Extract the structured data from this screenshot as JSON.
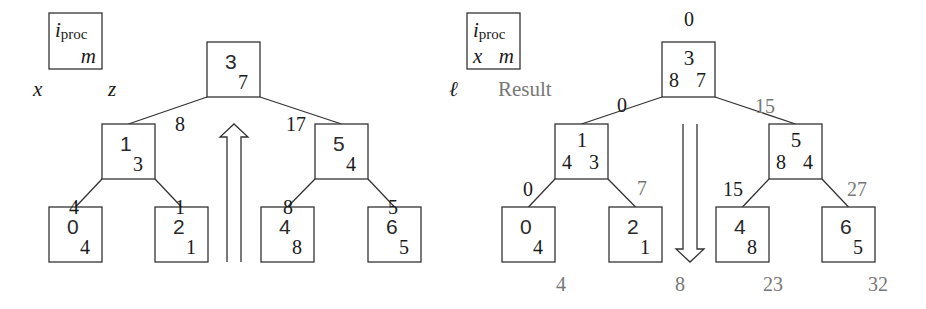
{
  "colors": {
    "stroke": "#333333",
    "text": "#1a1a1a",
    "result_gray": "#777777"
  },
  "left": {
    "legend": {
      "box": {
        "x": 49,
        "y": 13,
        "w": 53,
        "h": 56
      },
      "top_label": "i",
      "top_label_sub": "proc",
      "bottom_right": "m",
      "below_left": "x",
      "below_right": "z"
    },
    "nodes": [
      {
        "id": "3",
        "x": 207,
        "y": 42,
        "m": "7"
      },
      {
        "id": "1",
        "x": 102,
        "y": 124,
        "m": "3"
      },
      {
        "id": "5",
        "x": 315,
        "y": 124,
        "m": "4"
      },
      {
        "id": "0",
        "x": 49,
        "y": 207,
        "m": "4"
      },
      {
        "id": "2",
        "x": 155,
        "y": 207,
        "m": "1"
      },
      {
        "id": "4",
        "x": 261,
        "y": 207,
        "m": "8"
      },
      {
        "id": "6",
        "x": 368,
        "y": 207,
        "m": "5"
      }
    ],
    "edge_labels": [
      {
        "text": "8",
        "x": 180,
        "y": 131,
        "gray": false
      },
      {
        "text": "17",
        "x": 296,
        "y": 131,
        "gray": false
      },
      {
        "text": "4",
        "x": 74,
        "y": 214,
        "gray": false
      },
      {
        "text": "1",
        "x": 180,
        "y": 214,
        "gray": false
      },
      {
        "text": "8",
        "x": 288,
        "y": 214,
        "gray": false
      },
      {
        "text": "5",
        "x": 393,
        "y": 214,
        "gray": false
      }
    ],
    "arrow": {
      "direction": "up",
      "x": 234,
      "top": 124,
      "bottom": 262
    }
  },
  "right": {
    "legend": {
      "box": {
        "x": 467,
        "y": 13,
        "w": 53,
        "h": 56
      },
      "top_label": "i",
      "top_label_sub": "proc",
      "bottom_left": "x",
      "bottom_right": "m",
      "below_left": "ℓ",
      "result_label": "Result"
    },
    "nodes": [
      {
        "id": "3",
        "x": 662,
        "y": 42,
        "x_val": "8",
        "m": "7"
      },
      {
        "id": "1",
        "x": 555,
        "y": 124,
        "x_val": "4",
        "m": "3"
      },
      {
        "id": "5",
        "x": 769,
        "y": 124,
        "x_val": "8",
        "m": "4"
      },
      {
        "id": "0",
        "x": 502,
        "y": 207,
        "m": "4"
      },
      {
        "id": "2",
        "x": 609,
        "y": 207,
        "m": "1"
      },
      {
        "id": "4",
        "x": 716,
        "y": 207,
        "m": "8"
      },
      {
        "id": "6",
        "x": 822,
        "y": 207,
        "m": "5"
      }
    ],
    "edge_labels": [
      {
        "text": "0",
        "x": 689,
        "y": 26,
        "gray": false
      },
      {
        "text": "0",
        "x": 622,
        "y": 112,
        "gray": false
      },
      {
        "text": "15",
        "x": 765,
        "y": 113,
        "gray": true
      },
      {
        "text": "0",
        "x": 528,
        "y": 196,
        "gray": false
      },
      {
        "text": "7",
        "x": 642,
        "y": 195,
        "gray": true
      },
      {
        "text": "15",
        "x": 733,
        "y": 196,
        "gray": false
      },
      {
        "text": "27",
        "x": 857,
        "y": 196,
        "gray": true
      }
    ],
    "result_labels": [
      {
        "text": "4",
        "x": 561,
        "y": 291
      },
      {
        "text": "8",
        "x": 680,
        "y": 291
      },
      {
        "text": "23",
        "x": 773,
        "y": 291
      },
      {
        "text": "32",
        "x": 878,
        "y": 291
      }
    ],
    "arrow": {
      "direction": "down",
      "x": 690,
      "top": 124,
      "bottom": 262
    }
  },
  "node_size": {
    "w": 53,
    "h": 55
  }
}
